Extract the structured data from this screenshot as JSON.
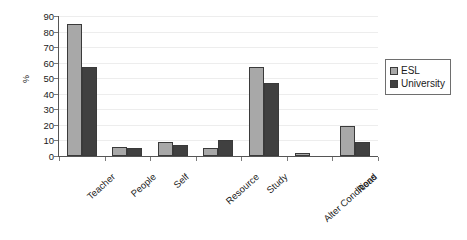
{
  "chart_data": {
    "type": "bar",
    "title": "",
    "subtitle": "",
    "xlabel": "",
    "ylabel": "%",
    "ylim": [
      0,
      90
    ],
    "ytick_step": 10,
    "yticks": [
      90,
      80,
      70,
      60,
      50,
      40,
      30,
      20,
      10,
      0
    ],
    "grid": true,
    "grid_axis": "y",
    "legend_position": "right",
    "categories": [
      "Teacher",
      "People",
      "Self",
      "Resource",
      "Study",
      "Alter Conditions",
      "Read"
    ],
    "series": [
      {
        "name": "ESL",
        "color": "#a8a8a8",
        "values": [
          85,
          6,
          9,
          5,
          57,
          2,
          19
        ]
      },
      {
        "name": "University",
        "color": "#404040",
        "values": [
          57,
          5,
          7,
          10,
          47,
          0,
          9
        ]
      }
    ]
  },
  "axes": {
    "y_title": "%"
  },
  "legend": {
    "entries": [
      {
        "label": "ESL",
        "swatch": "esl-swatch"
      },
      {
        "label": "University",
        "swatch": "university-swatch"
      }
    ]
  }
}
